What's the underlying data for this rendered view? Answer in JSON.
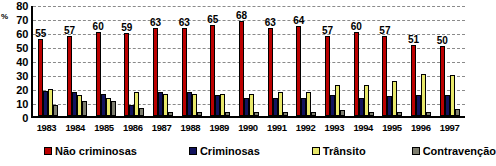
{
  "chart_data": {
    "type": "bar",
    "title": "",
    "xlabel": "",
    "ylabel": "%",
    "ylim": [
      0,
      80
    ],
    "ytick_step": 10,
    "yticks": [
      "80",
      "70",
      "60",
      "50",
      "40",
      "30",
      "20",
      "10",
      "0"
    ],
    "grid": true,
    "legend_position": "bottom",
    "categories": [
      "1983",
      "1984",
      "1985",
      "1986",
      "1987",
      "1988",
      "1989",
      "1990",
      "1991",
      "1992",
      "1993",
      "1994",
      "1995",
      "1996",
      "1997"
    ],
    "series": [
      {
        "name": "Não criminosas",
        "color": "#bb0000",
        "labeled": true,
        "values": [
          55,
          57,
          60,
          59,
          63,
          63,
          65,
          68,
          63,
          64,
          57,
          60,
          57,
          51,
          50
        ],
        "labels": [
          "55",
          "57",
          "60",
          "59",
          "63",
          "63",
          "65",
          "68",
          "63",
          "64",
          "57",
          "60",
          "57",
          "51",
          "50"
        ]
      },
      {
        "name": "Criminosas",
        "color": "#12135e",
        "labeled": false,
        "values": [
          18,
          17,
          16,
          8,
          17,
          17,
          15,
          13,
          13,
          13,
          15,
          13,
          14,
          15,
          15
        ]
      },
      {
        "name": "Trânsito",
        "color": "#e8e86a",
        "labeled": false,
        "values": [
          19,
          15,
          13,
          17,
          16,
          16,
          16,
          16,
          17,
          17,
          22,
          22,
          25,
          30,
          29
        ]
      },
      {
        "name": "Contravenção",
        "color": "#7d7d6e",
        "labeled": false,
        "values": [
          8,
          11,
          11,
          6,
          3,
          3,
          3,
          3,
          3,
          3,
          4,
          3,
          3,
          3,
          5
        ]
      }
    ]
  },
  "axis": {
    "unit_label": "%"
  },
  "legend": {
    "items": [
      {
        "label": "Não criminosas",
        "color": "#bb0000"
      },
      {
        "label": "Criminosas",
        "color": "#12135e"
      },
      {
        "label": "Trânsito",
        "color": "#e8e86a"
      },
      {
        "label": "Contravenção",
        "color": "#7d7d6e"
      }
    ]
  }
}
